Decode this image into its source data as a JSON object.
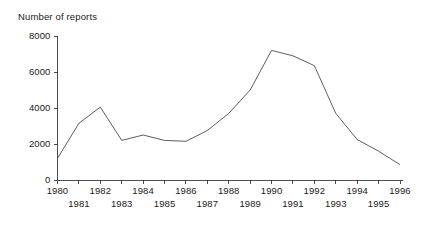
{
  "chart_data": {
    "type": "line",
    "title": "Number of reports",
    "xlabel": "",
    "ylabel": "",
    "ylim": [
      0,
      8000
    ],
    "xlim": [
      1980,
      1996
    ],
    "grid": false,
    "legend": null,
    "yticks": [
      0,
      2000,
      4000,
      6000,
      8000
    ],
    "ytick_labels": [
      "0",
      "2000",
      "4000",
      "6000",
      "8000"
    ],
    "categories": [
      "1980",
      "1981",
      "1982",
      "1983",
      "1984",
      "1985",
      "1986",
      "1987",
      "1988",
      "1989",
      "1990",
      "1991",
      "1992",
      "1993",
      "1994",
      "1995",
      "1996"
    ],
    "x": [
      1980,
      1981,
      1982,
      1983,
      1984,
      1985,
      1986,
      1987,
      1988,
      1989,
      1990,
      1991,
      1992,
      1993,
      1994,
      1995,
      1996
    ],
    "values": [
      1200,
      3150,
      4050,
      2200,
      2500,
      2200,
      2150,
      2750,
      3700,
      5000,
      7200,
      6900,
      6350,
      3700,
      2250,
      1600,
      850
    ],
    "series": [
      {
        "name": "Number of reports",
        "color": "#555555",
        "values": [
          1200,
          3150,
          4050,
          2200,
          2500,
          2200,
          2150,
          2750,
          3700,
          5000,
          7200,
          6900,
          6350,
          3700,
          2250,
          1600,
          850
        ]
      }
    ],
    "xtick_rows": {
      "upper": [
        "1980",
        "1982",
        "1984",
        "1986",
        "1988",
        "1990",
        "1992",
        "1994",
        "1996"
      ],
      "lower": [
        "1981",
        "1983",
        "1985",
        "1987",
        "1989",
        "1991",
        "1993",
        "1995"
      ]
    }
  },
  "colors": {
    "line": "#555555",
    "axis": "#3a3a3a",
    "text": "#1a1a1a",
    "background": "#ffffff"
  }
}
